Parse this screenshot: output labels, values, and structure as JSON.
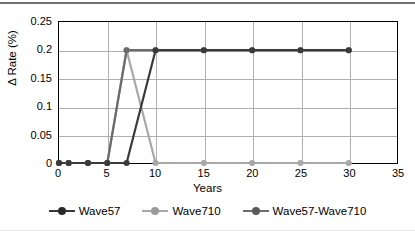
{
  "chart_data": {
    "type": "line",
    "title": "",
    "xlabel": "Years",
    "ylabel": "Δ Rate (%)",
    "xlim": [
      0,
      35
    ],
    "ylim": [
      0,
      0.25
    ],
    "grid": true,
    "legend_position": "bottom",
    "xticks": [
      "0",
      "5",
      "10",
      "15",
      "20",
      "25",
      "30",
      "35"
    ],
    "xtick_values": [
      0,
      5,
      10,
      15,
      20,
      25,
      30,
      35
    ],
    "yticks": [
      "0",
      "0.05",
      "0.1",
      "0.15",
      "0.2",
      "0.25"
    ],
    "ytick_values": [
      0,
      0.05,
      0.1,
      0.15,
      0.2,
      0.25
    ],
    "series": [
      {
        "name": "Wave57",
        "color": "#3a3a3a",
        "x": [
          0,
          1,
          3,
          5,
          7,
          10,
          15,
          20,
          25,
          30
        ],
        "values": [
          0,
          0,
          0,
          0,
          0,
          0.2,
          0.2,
          0.2,
          0.2,
          0.2
        ]
      },
      {
        "name": "Wave710",
        "color": "#a8a8a8",
        "x": [
          0,
          1,
          3,
          5,
          7,
          10,
          15,
          20,
          25,
          30
        ],
        "values": [
          0,
          0,
          0,
          0,
          0.2,
          0,
          0,
          0,
          0,
          0
        ]
      },
      {
        "name": "Wave57-Wave710",
        "color": "#6b6b6b",
        "x": [
          0,
          1,
          3,
          5,
          7,
          10,
          15,
          20,
          25,
          30
        ],
        "values": [
          0,
          0,
          0,
          0,
          0.2,
          0.2,
          0.2,
          0.2,
          0.2,
          0.2
        ]
      }
    ]
  },
  "legend": {
    "entries": [
      {
        "label": "Wave57"
      },
      {
        "label": "Wave710"
      },
      {
        "label": "Wave57-Wave710"
      }
    ]
  },
  "axes": {
    "x_title": "Years",
    "y_title": "Δ Rate (%)"
  },
  "colors": {
    "wave57": "#3a3a3a",
    "wave710": "#a8a8a8",
    "wave57_wave710": "#6b6b6b",
    "grid": "#b0b0b0",
    "axis": "#000000",
    "background": "#ffffff"
  }
}
